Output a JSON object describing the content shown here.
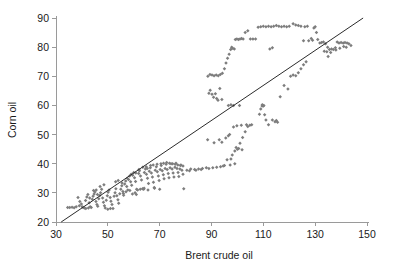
{
  "chart_data": {
    "type": "scatter",
    "title": "",
    "xlabel": "Brent crude oil",
    "ylabel": "Corn oil",
    "xlim": [
      30,
      150
    ],
    "ylim": [
      20,
      90
    ],
    "xticks": [
      30,
      50,
      70,
      90,
      110,
      130,
      150
    ],
    "yticks": [
      20,
      30,
      40,
      50,
      60,
      70,
      80,
      90
    ],
    "grid": false,
    "legend": null,
    "marker_color": "#7d7d7d",
    "trend_line": {
      "label": "",
      "color": "#2b2b2b",
      "x": [
        32.0,
        148.5
      ],
      "y": [
        20.0,
        90.0
      ]
    },
    "points": [
      [
        34.5,
        25.0
      ],
      [
        35.3,
        25.0
      ],
      [
        36.2,
        25.1
      ],
      [
        37.0,
        24.9
      ],
      [
        38.5,
        28.4
      ],
      [
        39.2,
        27.0
      ],
      [
        39.8,
        26.2
      ],
      [
        40.1,
        25.2
      ],
      [
        40.5,
        25.0
      ],
      [
        41.0,
        24.8
      ],
      [
        41.4,
        27.4
      ],
      [
        41.9,
        28.6
      ],
      [
        42.3,
        29.4
      ],
      [
        42.8,
        26.6
      ],
      [
        43.2,
        25.2
      ],
      [
        43.6,
        25.0
      ],
      [
        44.0,
        27.8
      ],
      [
        44.3,
        28.8
      ],
      [
        44.7,
        29.6
      ],
      [
        45.0,
        30.3
      ],
      [
        45.4,
        27.0
      ],
      [
        45.8,
        26.0
      ],
      [
        46.1,
        25.4
      ],
      [
        46.5,
        28.0
      ],
      [
        46.9,
        29.1
      ],
      [
        47.2,
        30.0
      ],
      [
        47.6,
        31.2
      ],
      [
        48.0,
        28.2
      ],
      [
        48.3,
        26.8
      ],
      [
        48.7,
        25.6
      ],
      [
        49.0,
        24.8
      ],
      [
        49.4,
        27.5
      ],
      [
        49.8,
        29.0
      ],
      [
        50.1,
        30.2
      ],
      [
        50.5,
        31.0
      ],
      [
        50.9,
        28.4
      ],
      [
        51.2,
        27.1
      ],
      [
        51.6,
        26.0
      ],
      [
        52.0,
        24.6
      ],
      [
        52.4,
        28.8
      ],
      [
        52.8,
        30.0
      ],
      [
        53.1,
        31.4
      ],
      [
        53.5,
        29.0
      ],
      [
        53.9,
        27.6
      ],
      [
        54.2,
        26.4
      ],
      [
        54.6,
        29.7
      ],
      [
        55.0,
        31.2
      ],
      [
        55.4,
        32.4
      ],
      [
        55.8,
        30.5
      ],
      [
        56.1,
        29.2
      ],
      [
        56.5,
        33.0
      ],
      [
        56.9,
        34.1
      ],
      [
        57.3,
        32.2
      ],
      [
        57.7,
        31.0
      ],
      [
        58.0,
        34.6
      ],
      [
        58.4,
        35.8
      ],
      [
        58.8,
        33.8
      ],
      [
        59.2,
        32.6
      ],
      [
        59.6,
        36.0
      ],
      [
        60.0,
        37.0
      ],
      [
        60.3,
        35.2
      ],
      [
        60.7,
        33.9
      ],
      [
        61.1,
        31.2
      ],
      [
        61.5,
        31.0
      ],
      [
        61.9,
        36.6
      ],
      [
        62.2,
        37.6
      ],
      [
        62.6,
        35.8
      ],
      [
        63.0,
        34.4
      ],
      [
        63.4,
        31.4
      ],
      [
        63.8,
        31.2
      ],
      [
        64.1,
        37.0
      ],
      [
        64.5,
        38.2
      ],
      [
        64.9,
        36.4
      ],
      [
        65.3,
        35.0
      ],
      [
        65.7,
        33.2
      ],
      [
        66.0,
        37.4
      ],
      [
        66.4,
        38.6
      ],
      [
        66.8,
        36.8
      ],
      [
        67.2,
        35.4
      ],
      [
        67.6,
        33.6
      ],
      [
        67.9,
        31.8
      ],
      [
        68.3,
        37.8
      ],
      [
        68.7,
        39.0
      ],
      [
        69.1,
        37.2
      ],
      [
        69.5,
        35.8
      ],
      [
        69.8,
        34.2
      ],
      [
        70.2,
        38.0
      ],
      [
        70.6,
        39.4
      ],
      [
        71.0,
        37.6
      ],
      [
        71.4,
        36.2
      ],
      [
        71.7,
        34.8
      ],
      [
        72.1,
        38.4
      ],
      [
        72.5,
        39.8
      ],
      [
        72.9,
        38.0
      ],
      [
        73.3,
        36.6
      ],
      [
        73.6,
        35.2
      ],
      [
        74.0,
        38.6
      ],
      [
        74.4,
        40.0
      ],
      [
        74.8,
        38.2
      ],
      [
        75.2,
        36.8
      ],
      [
        75.5,
        35.4
      ],
      [
        75.9,
        38.8
      ],
      [
        76.3,
        40.2
      ],
      [
        76.7,
        38.4
      ],
      [
        77.1,
        37.0
      ],
      [
        77.4,
        35.6
      ],
      [
        77.8,
        38.2
      ],
      [
        78.2,
        39.6
      ],
      [
        78.6,
        37.8
      ],
      [
        79.0,
        36.4
      ],
      [
        79.3,
        31.4
      ],
      [
        62.5,
        31.2
      ],
      [
        64.0,
        31.6
      ],
      [
        65.5,
        31.0
      ],
      [
        68.0,
        31.6
      ],
      [
        70.0,
        31.2
      ],
      [
        80.5,
        37.8
      ],
      [
        82.0,
        38.2
      ],
      [
        83.5,
        38.0
      ],
      [
        85.0,
        38.2
      ],
      [
        86.5,
        38.4
      ],
      [
        88.0,
        38.6
      ],
      [
        89.0,
        38.4
      ],
      [
        90.5,
        38.6
      ],
      [
        92.0,
        38.8
      ],
      [
        93.5,
        39.0
      ],
      [
        95.0,
        39.4
      ],
      [
        96.0,
        41.4
      ],
      [
        97.5,
        41.6
      ],
      [
        98.0,
        43.0
      ],
      [
        99.0,
        44.4
      ],
      [
        99.5,
        45.6
      ],
      [
        100.5,
        45.2
      ],
      [
        101.0,
        47.0
      ],
      [
        102.0,
        49.0
      ],
      [
        103.0,
        51.0
      ],
      [
        104.0,
        52.8
      ],
      [
        104.8,
        53.2
      ],
      [
        105.5,
        53.4
      ],
      [
        88.5,
        48.2
      ],
      [
        91.0,
        47.2
      ],
      [
        93.0,
        48.2
      ],
      [
        94.0,
        47.4
      ],
      [
        95.5,
        48.8
      ],
      [
        96.5,
        49.6
      ],
      [
        97.0,
        50.0
      ],
      [
        98.5,
        52.6
      ],
      [
        99.8,
        53.0
      ],
      [
        101.5,
        53.2
      ],
      [
        103.5,
        53.4
      ],
      [
        108.5,
        57.0
      ],
      [
        109.0,
        58.8
      ],
      [
        109.5,
        59.8
      ],
      [
        110.0,
        59.8
      ],
      [
        110.5,
        56.8
      ],
      [
        111.0,
        55.0
      ],
      [
        112.0,
        53.4
      ],
      [
        113.5,
        55.0
      ],
      [
        114.5,
        54.4
      ],
      [
        115.0,
        54.8
      ],
      [
        115.5,
        54.2
      ],
      [
        96.5,
        60.0
      ],
      [
        97.5,
        60.2
      ],
      [
        98.5,
        60.0
      ],
      [
        89.0,
        64.2
      ],
      [
        89.5,
        65.2
      ],
      [
        90.2,
        63.8
      ],
      [
        90.8,
        62.8
      ],
      [
        91.5,
        64.0
      ],
      [
        92.0,
        62.4
      ],
      [
        92.5,
        61.8
      ],
      [
        93.2,
        65.8
      ],
      [
        94.0,
        62.0
      ],
      [
        88.6,
        70.0
      ],
      [
        89.4,
        70.6
      ],
      [
        90.2,
        70.4
      ],
      [
        91.0,
        70.2
      ],
      [
        91.8,
        70.4
      ],
      [
        92.6,
        70.2
      ],
      [
        93.4,
        70.6
      ],
      [
        94.2,
        71.0
      ],
      [
        95.0,
        72.6
      ],
      [
        95.6,
        74.6
      ],
      [
        96.2,
        76.2
      ],
      [
        96.8,
        77.6
      ],
      [
        97.4,
        79.2
      ],
      [
        97.8,
        80.0
      ],
      [
        98.2,
        79.6
      ],
      [
        98.8,
        79.4
      ],
      [
        99.2,
        82.6
      ],
      [
        99.8,
        82.8
      ],
      [
        100.4,
        82.6
      ],
      [
        101.0,
        82.8
      ],
      [
        101.6,
        83.0
      ],
      [
        102.2,
        82.8
      ],
      [
        103.0,
        85.0
      ],
      [
        104.0,
        85.6
      ],
      [
        105.0,
        82.8
      ],
      [
        106.0,
        82.8
      ],
      [
        107.0,
        82.8
      ],
      [
        108.0,
        86.8
      ],
      [
        109.0,
        87.0
      ],
      [
        110.0,
        87.2
      ],
      [
        111.0,
        87.0
      ],
      [
        112.0,
        87.2
      ],
      [
        113.0,
        87.0
      ],
      [
        114.0,
        87.2
      ],
      [
        115.0,
        87.4
      ],
      [
        116.0,
        87.2
      ],
      [
        117.0,
        87.0
      ],
      [
        118.0,
        87.2
      ],
      [
        119.0,
        87.0
      ],
      [
        120.0,
        87.2
      ],
      [
        121.5,
        88.0
      ],
      [
        122.5,
        87.6
      ],
      [
        123.5,
        87.4
      ],
      [
        124.5,
        87.2
      ],
      [
        126.0,
        87.0
      ],
      [
        127.0,
        87.2
      ],
      [
        116.5,
        63.0
      ],
      [
        118.0,
        66.8
      ],
      [
        119.5,
        65.6
      ],
      [
        120.5,
        70.0
      ],
      [
        121.5,
        70.4
      ],
      [
        122.5,
        70.2
      ],
      [
        123.5,
        71.2
      ],
      [
        124.5,
        72.6
      ],
      [
        125.5,
        74.0
      ],
      [
        126.5,
        75.0
      ],
      [
        127.5,
        82.2
      ],
      [
        128.5,
        83.0
      ],
      [
        129.5,
        86.6
      ],
      [
        130.0,
        87.0
      ],
      [
        130.5,
        85.0
      ],
      [
        131.0,
        82.6
      ],
      [
        131.8,
        81.4
      ],
      [
        132.5,
        81.6
      ],
      [
        133.2,
        81.8
      ],
      [
        134.0,
        81.2
      ],
      [
        134.8,
        80.0
      ],
      [
        135.5,
        79.2
      ],
      [
        136.3,
        79.4
      ],
      [
        137.0,
        79.2
      ],
      [
        137.8,
        79.8
      ],
      [
        138.5,
        81.8
      ],
      [
        139.2,
        81.4
      ],
      [
        140.0,
        81.6
      ],
      [
        140.8,
        81.4
      ],
      [
        141.5,
        81.6
      ],
      [
        142.3,
        81.4
      ],
      [
        143.0,
        81.2
      ],
      [
        143.8,
        80.6
      ],
      [
        133.5,
        78.6
      ],
      [
        134.5,
        78.4
      ],
      [
        136.0,
        78.2
      ],
      [
        138.0,
        79.0
      ],
      [
        139.5,
        79.6
      ],
      [
        135.0,
        76.8
      ],
      [
        141.0,
        80.2
      ],
      [
        142.0,
        80.0
      ],
      [
        125.5,
        82.2
      ],
      [
        129.0,
        82.4
      ],
      [
        112.5,
        79.4
      ],
      [
        113.5,
        79.8
      ],
      [
        100.0,
        45.0
      ],
      [
        101.8,
        44.8
      ],
      [
        99.0,
        40.0
      ],
      [
        97.2,
        39.6
      ],
      [
        94.5,
        39.2
      ],
      [
        86.0,
        38.0
      ],
      [
        84.0,
        37.8
      ],
      [
        81.5,
        37.6
      ],
      [
        41.5,
        24.6
      ],
      [
        42.5,
        24.8
      ],
      [
        50.0,
        24.4
      ],
      [
        51.0,
        24.6
      ],
      [
        56.0,
        29.8
      ],
      [
        57.0,
        30.4
      ],
      [
        58.5,
        30.8
      ],
      [
        59.5,
        29.6
      ],
      [
        60.5,
        30.0
      ],
      [
        61.0,
        29.4
      ],
      [
        44.5,
        30.8
      ],
      [
        45.5,
        31.0
      ],
      [
        47.0,
        32.2
      ],
      [
        48.5,
        32.8
      ],
      [
        53.0,
        33.8
      ],
      [
        54.0,
        34.2
      ],
      [
        66.5,
        39.4
      ],
      [
        67.5,
        39.6
      ],
      [
        69.0,
        39.8
      ],
      [
        70.5,
        40.0
      ],
      [
        71.5,
        40.2
      ],
      [
        72.7,
        40.4
      ],
      [
        73.8,
        40.2
      ],
      [
        75.0,
        40.0
      ],
      [
        76.0,
        39.8
      ],
      [
        77.0,
        39.6
      ],
      [
        78.0,
        39.4
      ],
      [
        79.0,
        39.2
      ],
      [
        63.5,
        38.8
      ],
      [
        64.8,
        39.0
      ],
      [
        65.2,
        38.4
      ],
      [
        62.0,
        38.0
      ],
      [
        59.0,
        36.4
      ],
      [
        60.8,
        36.8
      ],
      [
        57.5,
        35.0
      ],
      [
        55.5,
        33.4
      ],
      [
        46.0,
        29.4
      ],
      [
        43.0,
        28.2
      ],
      [
        39.0,
        25.6
      ],
      [
        37.8,
        25.2
      ],
      [
        100.8,
        60.0
      ],
      [
        110.2,
        60.0
      ],
      [
        109.6,
        60.2
      ]
    ]
  }
}
